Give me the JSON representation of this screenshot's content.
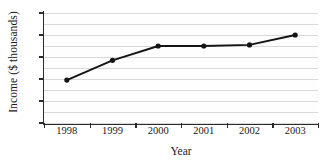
{
  "chart_data": {
    "type": "line",
    "title": "",
    "xlabel": "Year",
    "ylabel": "Income ($ thousands)",
    "categories": [
      "1998",
      "1999",
      "2000",
      "2001",
      "2002",
      "2003"
    ],
    "values": [
      38.9,
      40.7,
      42.0,
      42.0,
      42.1,
      43.0
    ],
    "series": [
      {
        "name": "Income",
        "values": [
          38.9,
          40.7,
          42.0,
          42.0,
          42.1,
          43.0
        ]
      }
    ],
    "ylim": [
      35,
      45
    ],
    "yticks": [
      35,
      37,
      39,
      41,
      43,
      45
    ],
    "ytick_labels": [
      "35",
      "37",
      "39",
      "41",
      "43",
      "45"
    ],
    "gridlines": [
      35,
      36,
      37,
      38,
      39,
      40,
      41,
      42,
      43,
      44,
      45
    ],
    "grid": true,
    "legend": "none",
    "marker": "filled-circle",
    "line_color": "#141414",
    "marker_color": "#141414",
    "grid_color": "#d9d9d9",
    "axis_color": "#2b2b2b",
    "background_color": "#ffffff"
  }
}
